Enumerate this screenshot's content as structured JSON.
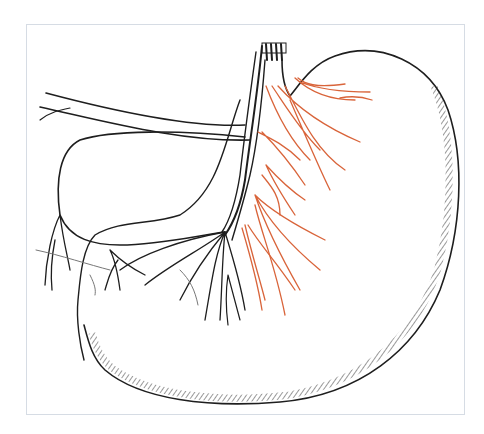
{
  "figure": {
    "colors": {
      "outline": "#1e1e1e",
      "nerve_highlight": "#d9643a",
      "frame_border": "#d6dce4",
      "background": "#ffffff"
    }
  }
}
